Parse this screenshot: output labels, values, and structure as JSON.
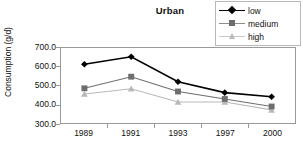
{
  "chart_data": {
    "type": "line",
    "title": "Urban",
    "xlabel": "",
    "ylabel": "Consumption (g/d)",
    "categories": [
      "1989",
      "1991",
      "1993",
      "1997",
      "2000"
    ],
    "ylim": [
      300.0,
      700.0
    ],
    "yticks": [
      "700.0",
      "600.0",
      "500.0",
      "400.0",
      "300.0"
    ],
    "ytick_values": [
      700.0,
      600.0,
      500.0,
      400.0,
      300.0
    ],
    "grid": false,
    "legend_position": "top-right",
    "series": [
      {
        "name": "low",
        "color": "#000000",
        "marker": "diamond",
        "values": [
          613,
          653,
          520,
          462,
          440
        ]
      },
      {
        "name": "medium",
        "color": "#6e6e6e",
        "marker": "square",
        "values": [
          485,
          547,
          468,
          428,
          388
        ]
      },
      {
        "name": "high",
        "color": "#b9b9b9",
        "marker": "triangle",
        "values": [
          455,
          483,
          412,
          412,
          370
        ]
      }
    ]
  },
  "legend": {
    "items": [
      {
        "label": "low"
      },
      {
        "label": "medium"
      },
      {
        "label": "high"
      }
    ]
  },
  "axis": {
    "y_title": "Consumption (g/d)",
    "y_labels": [
      "700.0",
      "600.0",
      "500.0",
      "400.0",
      "300.0"
    ],
    "x_labels": [
      "1989",
      "1991",
      "1993",
      "1997",
      "2000"
    ]
  },
  "colors": {
    "low": "#000000",
    "medium": "#6e6e6e",
    "high": "#b9b9b9",
    "frame": "#9a9a9a",
    "text": "#111111"
  }
}
